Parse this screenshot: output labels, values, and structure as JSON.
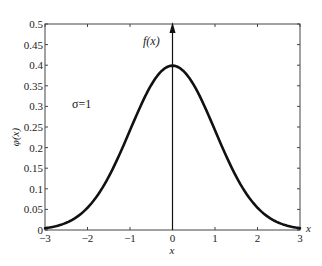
{
  "chart_data": {
    "type": "line",
    "title": "",
    "xlabel": "x",
    "ylabel": "φ(x)",
    "annotations": [
      {
        "text": "σ=1",
        "x": -2.2,
        "y": 0.31
      },
      {
        "text": "f(x)",
        "x": -0.45,
        "y": 0.455,
        "note": "label of vertical arrow axis at x=0"
      },
      {
        "text": "x",
        "x": 3.15,
        "y": 0.005,
        "note": "label at right end of horizontal axis"
      }
    ],
    "xlim": [
      -3,
      3
    ],
    "ylim": [
      0,
      0.5
    ],
    "xticks": [
      -3,
      -2,
      -1,
      0,
      1,
      2,
      3
    ],
    "xtick_labels": [
      "−3",
      "−2",
      "−1",
      "0",
      "1",
      "2",
      "3"
    ],
    "yticks": [
      0,
      0.05,
      0.1,
      0.15,
      0.2,
      0.25,
      0.3,
      0.35,
      0.4,
      0.45,
      0.5
    ],
    "ytick_labels": [
      "0",
      "0.05",
      "0.1",
      "0.15",
      "0.2",
      "0.25",
      "0.3",
      "0.35",
      "0.4",
      "0.45",
      "0.5"
    ],
    "grid": false,
    "legend": null,
    "series": [
      {
        "name": "standard normal density φ(x), σ=1",
        "x": [
          -3,
          -2.5,
          -2,
          -1.5,
          -1,
          -0.5,
          0,
          0.5,
          1,
          1.5,
          2,
          2.5,
          3
        ],
        "values": [
          0.0044,
          0.0175,
          0.054,
          0.1295,
          0.242,
          0.3521,
          0.3989,
          0.3521,
          0.242,
          0.1295,
          0.054,
          0.0175,
          0.0044
        ]
      }
    ],
    "vertical_axis_arrow_at_x": 0
  },
  "labels": {
    "sigma": "σ=1",
    "fx": "f(x)",
    "ylabel": "φ(x)",
    "xlabel_bottom": "x",
    "xlabel_right": "x"
  },
  "colors": {
    "curve": "#111111",
    "axes": "#333333"
  }
}
